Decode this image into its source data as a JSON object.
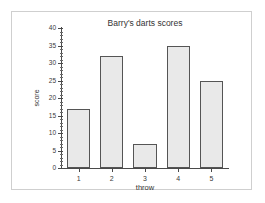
{
  "chart_data": {
    "type": "bar",
    "title": "Barry's darts scores",
    "xlabel": "throw",
    "ylabel": "score",
    "categories": [
      "1",
      "2",
      "3",
      "4",
      "5"
    ],
    "values": [
      17,
      32,
      7,
      35,
      25
    ],
    "ylim": [
      0,
      40
    ],
    "ytick_labels": [
      "0",
      "5",
      "10",
      "15",
      "20",
      "25",
      "30",
      "35",
      "40"
    ],
    "ytick_values": [
      0,
      5,
      10,
      15,
      20,
      25,
      30,
      35,
      40
    ],
    "ytick_minor_step": 1,
    "grid": false,
    "legend": null,
    "bar_fill_color": "#e9e9e9",
    "bar_edge_color": "#555555",
    "axis_color": "#4a4a4a",
    "background_color": "#ffffff",
    "frame_color": "#cfcfcf"
  }
}
